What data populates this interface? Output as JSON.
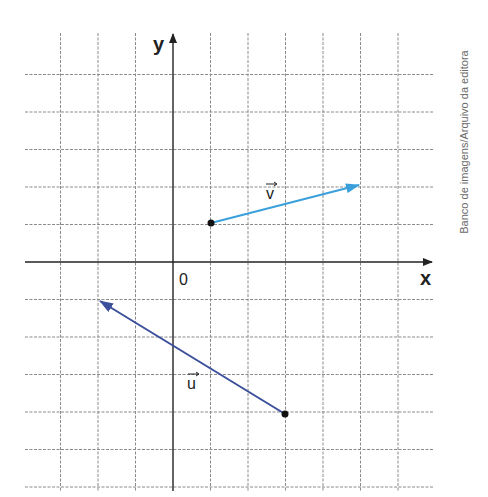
{
  "diagram": {
    "title": "",
    "axes": {
      "x_label": "x",
      "y_label": "y",
      "origin_label": "0"
    },
    "grid": {
      "x_range": [
        -4,
        7
      ],
      "y_range": [
        -6,
        6
      ],
      "unit": 1,
      "style": "dashed"
    },
    "vectors": [
      {
        "name": "v",
        "label": "v",
        "tail": [
          1,
          1
        ],
        "head": [
          5,
          2
        ],
        "components": [
          4,
          1
        ],
        "color": "#3aa0dc"
      },
      {
        "name": "u",
        "label": "u",
        "tail": [
          3,
          -4
        ],
        "head": [
          -2,
          -1
        ],
        "components": [
          -5,
          3
        ],
        "color": "#3b4f9a"
      }
    ],
    "credit": "Banco de imagens/Arquivo da editora"
  },
  "colors": {
    "grid": "#8a8a8a",
    "axis": "#222222",
    "vector_v": "#3aa0dc",
    "vector_u": "#3b4f9a",
    "point": "#111111"
  }
}
